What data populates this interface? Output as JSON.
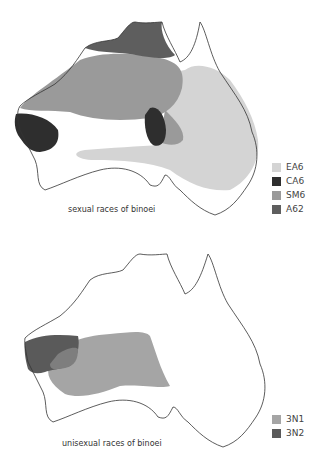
{
  "maps": [
    {
      "caption": "sexual races of binoei",
      "legend": [
        {
          "label": "EA6",
          "color": "#d4d4d4"
        },
        {
          "label": "CA6",
          "color": "#2e2e2e"
        },
        {
          "label": "SM6",
          "color": "#9a9a9a"
        },
        {
          "label": "A62",
          "color": "#5e5e5e"
        }
      ]
    },
    {
      "caption": "unisexual races of binoei",
      "legend": [
        {
          "label": "3N1",
          "color": "#a5a5a5"
        },
        {
          "label": "3N2",
          "color": "#5a5a5a"
        }
      ]
    }
  ]
}
